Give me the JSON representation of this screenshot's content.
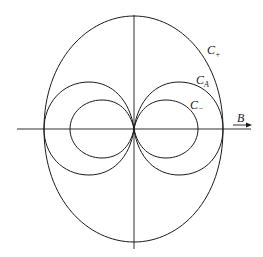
{
  "diagram": {
    "type": "polar-curves",
    "axes": {
      "horizontal_label": "B",
      "horizontal_arrow": true,
      "vertical_label": ""
    },
    "curves": [
      {
        "name": "C+",
        "label_main": "C",
        "label_sub": "+",
        "shape": "outer rounded oval enclosing all"
      },
      {
        "name": "CA",
        "label_main": "C",
        "label_sub": "A",
        "shape": "two circular lobes touching at origin"
      },
      {
        "name": "C-",
        "label_main": "C",
        "label_sub": "−",
        "shape": "two smaller oval lobes touching at origin"
      }
    ]
  }
}
